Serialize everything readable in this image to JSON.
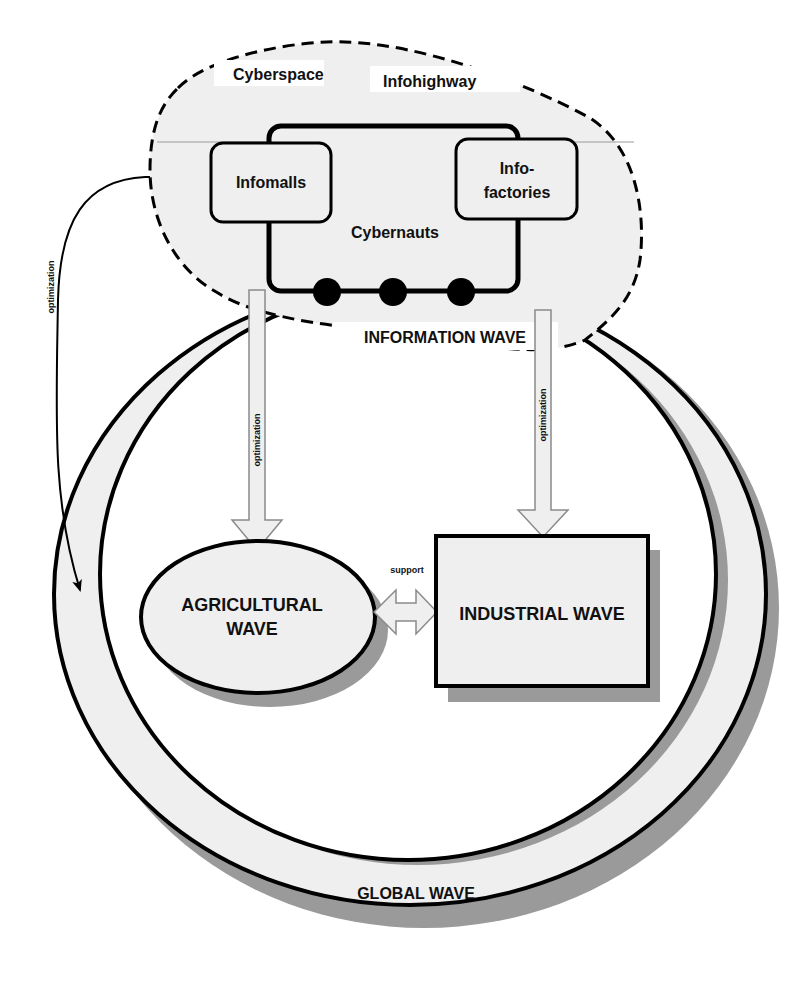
{
  "diagram": {
    "cloud": {
      "title": "Cyberspace",
      "highway_label": "Infohighway",
      "left_node": "Infomalls",
      "right_node_line1": "Info-",
      "right_node_line2": "factories",
      "cybernauts_label": "Cybernauts",
      "cybernaut_count": 3,
      "wave_label": "INFORMATION WAVE"
    },
    "ring": {
      "label": "GLOBAL WAVE"
    },
    "agricultural": {
      "line1": "AGRICULTURAL",
      "line2": "WAVE"
    },
    "industrial": {
      "label": "INDUSTRIAL WAVE"
    },
    "edges": {
      "info_to_agricultural": "optimization",
      "info_to_industrial": "optimization",
      "info_to_global": "optimization",
      "agricultural_industrial": "support"
    },
    "colors": {
      "fill_light": "#efefef",
      "shadow": "#9a9a9a",
      "stroke": "#000000",
      "background": "#ffffff"
    }
  }
}
